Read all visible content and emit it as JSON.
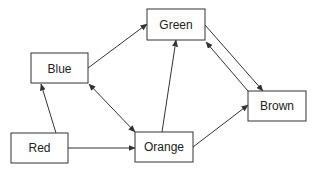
{
  "diagram": {
    "type": "directed-graph",
    "stroke_color": "#333333",
    "background": "#ffffff",
    "nodes": [
      {
        "id": "green",
        "label": "Green",
        "x": 147,
        "y": 9,
        "w": 58,
        "h": 31
      },
      {
        "id": "blue",
        "label": "Blue",
        "x": 31,
        "y": 53,
        "w": 57,
        "h": 30
      },
      {
        "id": "brown",
        "label": "Brown",
        "x": 248,
        "y": 91,
        "w": 58,
        "h": 30
      },
      {
        "id": "red",
        "label": "Red",
        "x": 11,
        "y": 133,
        "w": 57,
        "h": 30
      },
      {
        "id": "orange",
        "label": "Orange",
        "x": 135,
        "y": 132,
        "w": 58,
        "h": 30
      }
    ],
    "edges": [
      {
        "from": "blue",
        "to": "green",
        "bidirectional": false
      },
      {
        "from": "blue",
        "to": "orange",
        "bidirectional": true
      },
      {
        "from": "red",
        "to": "blue",
        "bidirectional": false
      },
      {
        "from": "red",
        "to": "orange",
        "bidirectional": false
      },
      {
        "from": "orange",
        "to": "green",
        "bidirectional": false
      },
      {
        "from": "orange",
        "to": "brown",
        "bidirectional": false
      },
      {
        "from": "green",
        "to": "brown",
        "bidirectional": false
      },
      {
        "from": "brown",
        "to": "green",
        "bidirectional": false
      }
    ]
  }
}
